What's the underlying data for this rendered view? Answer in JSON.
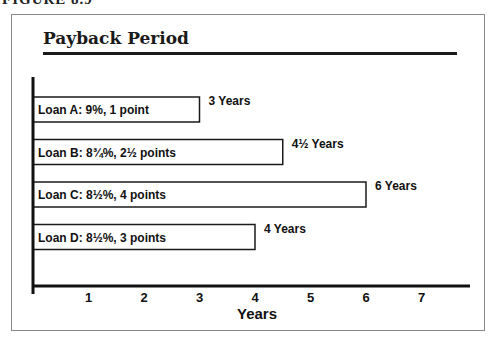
{
  "figure": {
    "caption": "FIGURE 8.9"
  },
  "chart_data": {
    "type": "bar",
    "orientation": "horizontal",
    "title": "Payback Period",
    "xlabel": "Years",
    "ylabel": "",
    "xlim": [
      0,
      7.8
    ],
    "xticks": [
      1,
      2,
      3,
      4,
      5,
      6,
      7
    ],
    "grid": false,
    "legend": "none",
    "categories": [
      "Loan A: 9%, 1 point",
      "Loan B: 8¾%, 2½ points",
      "Loan C: 8½%, 4 points",
      "Loan D: 8½%, 3 points"
    ],
    "values": [
      3,
      4.5,
      6,
      4
    ],
    "value_labels": [
      "3 Years",
      "4½ Years",
      "6 Years",
      "4 Years"
    ],
    "bar_fill": "#ffffff",
    "bar_stroke": "#1a1a1a"
  }
}
